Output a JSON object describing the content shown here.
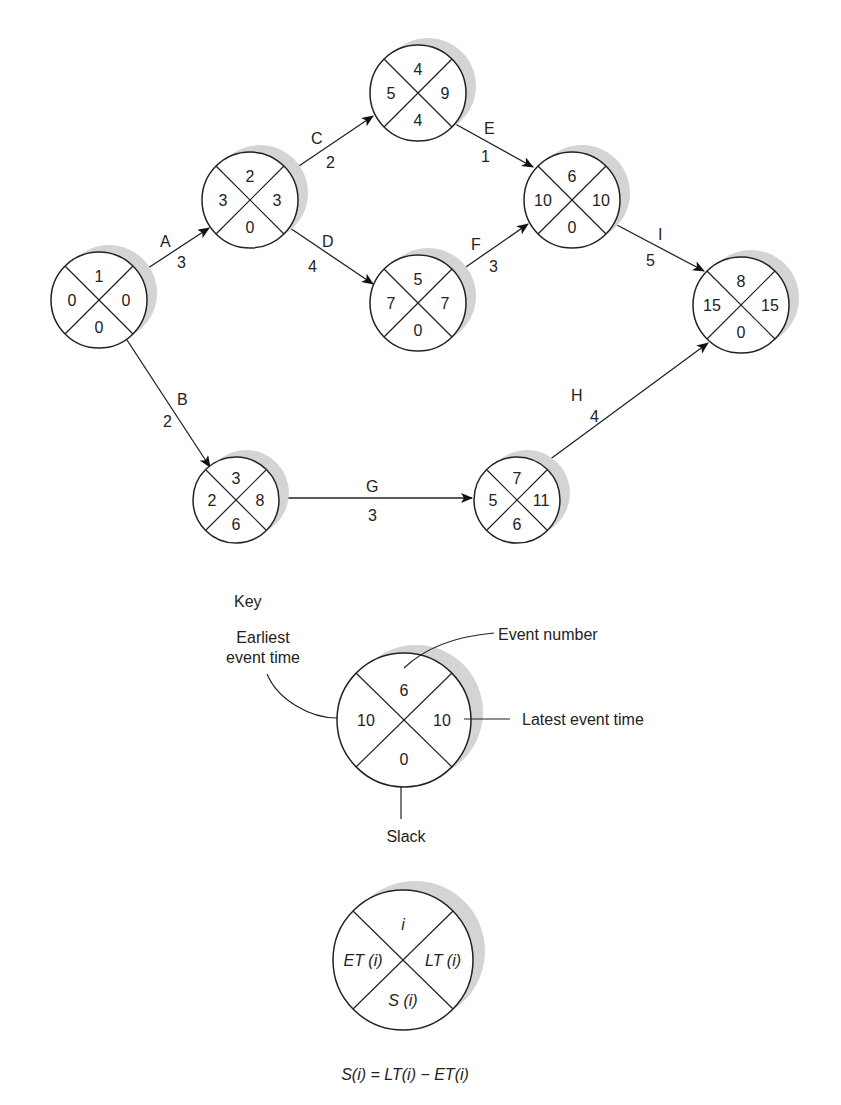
{
  "diagram": {
    "type": "PERT / CPM network (event-on-node)",
    "nodes": [
      {
        "id": "1",
        "event": "1",
        "et": "0",
        "lt": "0",
        "slack": "0",
        "cx": 99,
        "cy": 300,
        "r": 48
      },
      {
        "id": "2",
        "event": "2",
        "et": "3",
        "lt": "3",
        "slack": "0",
        "cx": 250,
        "cy": 200,
        "r": 48
      },
      {
        "id": "4",
        "event": "4",
        "et": "5",
        "lt": "9",
        "slack": "4",
        "cx": 418,
        "cy": 93,
        "r": 48
      },
      {
        "id": "5",
        "event": "5",
        "et": "7",
        "lt": "7",
        "slack": "0",
        "cx": 418,
        "cy": 303,
        "r": 48
      },
      {
        "id": "6",
        "event": "6",
        "et": "10",
        "lt": "10",
        "slack": "0",
        "cx": 572,
        "cy": 200,
        "r": 48
      },
      {
        "id": "8",
        "event": "8",
        "et": "15",
        "lt": "15",
        "slack": "0",
        "cx": 741,
        "cy": 305,
        "r": 48
      },
      {
        "id": "3",
        "event": "3",
        "et": "2",
        "lt": "8",
        "slack": "6",
        "cx": 236,
        "cy": 500,
        "r": 43
      },
      {
        "id": "7",
        "event": "7",
        "et": "5",
        "lt": "11",
        "slack": "6",
        "cx": 517,
        "cy": 500,
        "r": 43
      }
    ],
    "activities": [
      {
        "name": "A",
        "duration": "3",
        "from": "1",
        "to": "2"
      },
      {
        "name": "B",
        "duration": "2",
        "from": "1",
        "to": "3"
      },
      {
        "name": "C",
        "duration": "2",
        "from": "2",
        "to": "4"
      },
      {
        "name": "D",
        "duration": "4",
        "from": "2",
        "to": "5"
      },
      {
        "name": "E",
        "duration": "1",
        "from": "4",
        "to": "6"
      },
      {
        "name": "F",
        "duration": "3",
        "from": "5",
        "to": "6"
      },
      {
        "name": "G",
        "duration": "3",
        "from": "3",
        "to": "7"
      },
      {
        "name": "H",
        "duration": "4",
        "from": "7",
        "to": "8"
      },
      {
        "name": "I",
        "duration": "5",
        "from": "6",
        "to": "8"
      }
    ]
  },
  "key": {
    "title": "Key",
    "example": {
      "event": "6",
      "et": "10",
      "lt": "10",
      "slack": "0"
    },
    "labels": {
      "earliest_line1": "Earliest",
      "earliest_line2": "event time",
      "event_number": "Event number",
      "latest": "Latest event time",
      "slack": "Slack"
    },
    "symbolic": {
      "event": "i",
      "et": "ET (i)",
      "lt": "LT (i)",
      "slack": "S (i)"
    },
    "formula": "S(i) = LT(i) − ET(i)"
  }
}
